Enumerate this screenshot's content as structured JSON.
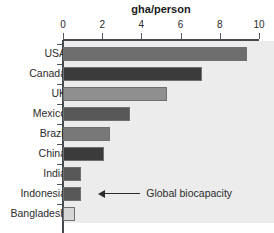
{
  "chart_data": {
    "type": "bar",
    "orientation": "horizontal",
    "title": "gha/person",
    "xlabel": "gha/person",
    "ylabel": "",
    "xlim": [
      0,
      10
    ],
    "xticks": [
      0,
      2,
      4,
      6,
      8,
      10
    ],
    "xtick_labels": [
      "0",
      "2",
      "4",
      "6",
      "8",
      "10"
    ],
    "grid": false,
    "legend": "none",
    "categories": [
      "USA",
      "Canada",
      "UK",
      "Mexico",
      "Brazil",
      "China",
      "India",
      "Indonesia",
      "Bangladesh"
    ],
    "values": [
      9.4,
      7.1,
      5.3,
      3.4,
      2.4,
      2.1,
      0.9,
      0.9,
      0.6
    ],
    "bar_colors": [
      "#6e6e6e",
      "#3b3b3b",
      "#8f8f8f",
      "#575757",
      "#787878",
      "#3b3b3b",
      "#575757",
      "#575757",
      "#d6d6d6"
    ],
    "annotations": [
      {
        "text": "Global biocapacity",
        "points_to_value": 1.8,
        "row_index": 7,
        "arrow": "left"
      }
    ],
    "plot_background": "#ececec",
    "axis_color": "#45484c"
  },
  "title": {
    "text": "gha/person"
  },
  "axis": {
    "ticks": [
      {
        "label": "0",
        "value": 0
      },
      {
        "label": "2",
        "value": 2
      },
      {
        "label": "4",
        "value": 4
      },
      {
        "label": "6",
        "value": 6
      },
      {
        "label": "8",
        "value": 8
      },
      {
        "label": "10",
        "value": 10
      }
    ]
  },
  "bars": [
    {
      "label": "USA",
      "value": 9.4,
      "color": "#6e6e6e"
    },
    {
      "label": "Canada",
      "value": 7.1,
      "color": "#3b3b3b"
    },
    {
      "label": "UK",
      "value": 5.3,
      "color": "#8f8f8f"
    },
    {
      "label": "Mexico",
      "value": 3.4,
      "color": "#575757"
    },
    {
      "label": "Brazil",
      "value": 2.4,
      "color": "#787878"
    },
    {
      "label": "China",
      "value": 2.1,
      "color": "#3b3b3b"
    },
    {
      "label": "India",
      "value": 0.9,
      "color": "#575757"
    },
    {
      "label": "Indonesia",
      "value": 0.9,
      "color": "#575757"
    },
    {
      "label": "Bangladesh",
      "value": 0.6,
      "color": "#d6d6d6"
    }
  ],
  "annotation": {
    "text": "Global biocapacity",
    "value": 1.8
  }
}
